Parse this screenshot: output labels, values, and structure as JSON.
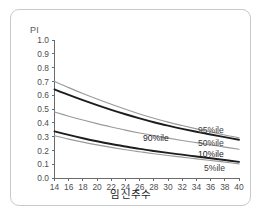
{
  "figure": {
    "y_axis_title": "PI",
    "x_axis_title": "임신주수",
    "caption": ""
  },
  "chart_data": {
    "type": "line",
    "title": "",
    "subtitle": "",
    "xlabel": "임신주수",
    "ylabel": "PI",
    "xlim": [
      14,
      40
    ],
    "ylim": [
      0.0,
      1.0
    ],
    "grid": false,
    "legend_position": "inline-right",
    "x_tick_labels": [
      "14",
      "16",
      "18",
      "20",
      "22",
      "24",
      "26",
      "28",
      "30",
      "32",
      "34",
      "36",
      "38",
      "40"
    ],
    "y_tick_labels": [
      "1.0",
      "0.9",
      "0.8",
      "0.7",
      "0.6",
      "0.5",
      "0.4",
      "0.3",
      "0.2",
      "0.1",
      "0.0"
    ],
    "x": [
      14,
      16,
      18,
      20,
      22,
      24,
      26,
      28,
      30,
      32,
      34,
      36,
      38,
      40
    ],
    "series": [
      {
        "name": "95%ile",
        "label": "95%ile",
        "style": "thin",
        "color": "#9a9a9c",
        "values": [
          0.7,
          0.655,
          0.612,
          0.572,
          0.534,
          0.498,
          0.464,
          0.433,
          0.405,
          0.38,
          0.356,
          0.334,
          0.312,
          0.292
        ]
      },
      {
        "name": "90%ile",
        "label": "90%ile",
        "style": "thick",
        "color": "#1d1d1f",
        "values": [
          0.642,
          0.602,
          0.564,
          0.528,
          0.494,
          0.462,
          0.432,
          0.404,
          0.379,
          0.356,
          0.335,
          0.315,
          0.296,
          0.277
        ]
      },
      {
        "name": "50%ile",
        "label": "50%ile",
        "style": "thin",
        "color": "#9a9a9c",
        "values": [
          0.478,
          0.448,
          0.42,
          0.394,
          0.37,
          0.347,
          0.326,
          0.307,
          0.289,
          0.272,
          0.256,
          0.24,
          0.224,
          0.208
        ]
      },
      {
        "name": "10%ile",
        "label": "10%ile",
        "style": "thick",
        "color": "#1d1d1f",
        "values": [
          0.338,
          0.312,
          0.288,
          0.266,
          0.246,
          0.228,
          0.211,
          0.196,
          0.182,
          0.169,
          0.156,
          0.143,
          0.13,
          0.117
        ]
      },
      {
        "name": "5%ile",
        "label": "5%ile",
        "style": "thin",
        "color": "#9a9a9c",
        "values": [
          0.306,
          0.282,
          0.26,
          0.24,
          0.222,
          0.205,
          0.19,
          0.176,
          0.163,
          0.151,
          0.139,
          0.127,
          0.115,
          0.102
        ]
      }
    ],
    "inline_labels": [
      {
        "text": "95%ile",
        "x_px": 198,
        "y_px": 133
      },
      {
        "text": "90%ile",
        "x_px": 143,
        "y_px": 141
      },
      {
        "text": "50%ile",
        "x_px": 198,
        "y_px": 146
      },
      {
        "text": "10%ile",
        "x_px": 198,
        "y_px": 157
      },
      {
        "text": "5%ile",
        "x_px": 204,
        "y_px": 171
      }
    ]
  }
}
